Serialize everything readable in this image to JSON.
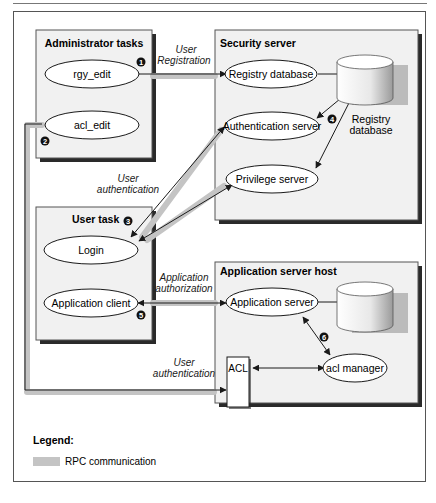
{
  "diagram": {
    "groups": {
      "admin": {
        "title": "Administrator tasks",
        "nodes": [
          "rgy_edit",
          "acl_edit"
        ]
      },
      "security": {
        "title": "Security server",
        "nodes": [
          "Registry database",
          "Authentication server",
          "Privilege server"
        ],
        "db_label_line1": "Registry",
        "db_label_line2": "database"
      },
      "user": {
        "title": "User task",
        "nodes": [
          "Login",
          "Application client"
        ]
      },
      "appserver": {
        "title": "Application server host",
        "nodes": [
          "Application server",
          "acl manager"
        ],
        "acl_box": "ACL"
      }
    },
    "edge_labels": {
      "user_registration_1": "User",
      "user_registration_2": "Registration",
      "user_authentication_top_1": "User",
      "user_authentication_top_2": "authentication",
      "application_authorization_1": "Application",
      "application_authorization_2": "authorization",
      "user_authentication_bottom_1": "User",
      "user_authentication_bottom_2": "authentication"
    },
    "step_markers": [
      "1",
      "2",
      "3",
      "4",
      "5",
      "6"
    ],
    "legend": {
      "title": "Legend:",
      "items": [
        {
          "label": "RPC communication",
          "color": "#c4c4c4"
        }
      ]
    },
    "colors": {
      "box_fill": "#f1f1f1",
      "shadow": "#2a2a2a",
      "rpc": "#c4c4c4",
      "line": "#1a1a1a"
    }
  }
}
